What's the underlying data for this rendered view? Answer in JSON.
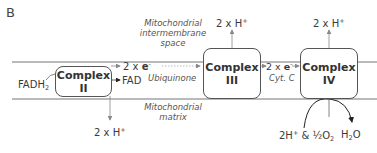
{
  "panel_label": "B",
  "regions": {
    "intermembrane": [
      "Mitochondrial",
      "intermembrane",
      "space"
    ],
    "matrix": [
      "Mitochondrial",
      "matrix"
    ]
  },
  "complexes": [
    {
      "name": "Complex",
      "num": "II"
    },
    {
      "name": "Complex",
      "num": "III"
    },
    {
      "name": "Complex",
      "num": "IV"
    }
  ],
  "labels": {
    "fadh2": {
      "base": "FADH",
      "sub": "2"
    },
    "fad": "FAD",
    "electrons_1": {
      "prefix": "2 x ",
      "e": "e",
      "sup": "-"
    },
    "ubiquinone": "Ubiquinone",
    "electrons_2": {
      "prefix": "2 x ",
      "e": "e",
      "sup": "-"
    },
    "cyt_c": "Cyt. C",
    "protons_ii": {
      "text": "2 x H",
      "sup": "+"
    },
    "protons_iii": {
      "text": "2 x H",
      "sup": "+"
    },
    "protons_iv": {
      "text": "2 x H",
      "sup": "+"
    },
    "oxygen_in": {
      "a": "2H",
      "sup": "+",
      "b": " & ½O",
      "sub": "2"
    },
    "water_out": {
      "a": "H",
      "sub": "2",
      "b": "O"
    }
  },
  "colors": {
    "membrane": "#777777",
    "box_border": "#555555",
    "arrow": "#888888",
    "dotted": "#aaaaaa"
  }
}
